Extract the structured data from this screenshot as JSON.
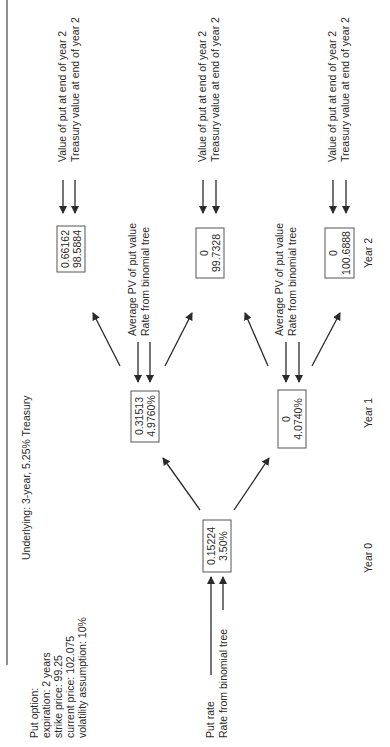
{
  "title": "Underlying: 3-year, 5.25% Treasury",
  "put_option": {
    "heading": "Put option:",
    "lines": [
      "expiration: 2 years",
      "strike price: 99.25",
      "current price: 102.075",
      "volatility assumption: 10%"
    ]
  },
  "root_legend": {
    "line1": "Put rate",
    "line2": "Rate from binomial tree"
  },
  "year1_legend": {
    "line1": "Average PV of put value",
    "line2": "Rate from binomial tree"
  },
  "year2_legend": {
    "line1": "Value of put at end of year 2",
    "line2": "Treasury value at end of year 2"
  },
  "years": [
    "Year 0",
    "Year 1",
    "Year 2"
  ],
  "nodes": {
    "year0": {
      "top": "0.15224",
      "bottom": "3.50%"
    },
    "year1_up": {
      "top": "0.31513",
      "bottom": "4.9760%"
    },
    "year1_down": {
      "top": "0",
      "bottom": "4.0740%"
    },
    "year2_uu": {
      "top": "0.66162",
      "bottom": "98.5884"
    },
    "year2_ud": {
      "top": "0",
      "bottom": "99.7328"
    },
    "year2_dd": {
      "top": "0",
      "bottom": "100.6888"
    }
  },
  "colors": {
    "ink": "#2a2a2a",
    "background": "#ffffff"
  }
}
